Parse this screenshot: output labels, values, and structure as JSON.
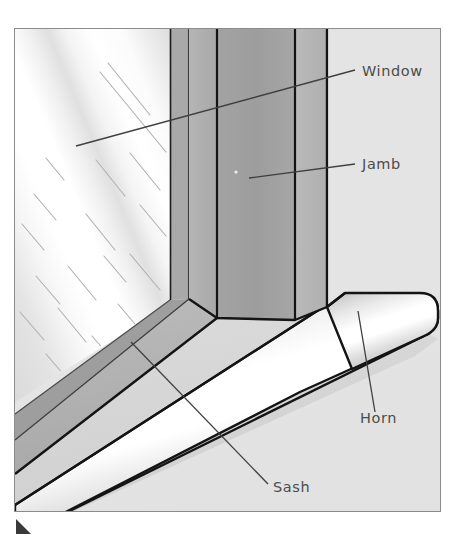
{
  "figure": {
    "bounds": {
      "x": 14,
      "y": 28,
      "width": 427,
      "height": 484
    },
    "background_color": "#ffffff",
    "panel_color": "#e6e6e6",
    "border_color": "#8c8c8c"
  },
  "labels": [
    {
      "id": "window",
      "text": "Window",
      "text_x": 362,
      "text_y": 76,
      "leader": {
        "x1": 355,
        "y1": 70,
        "x2": 76,
        "y2": 146
      },
      "color": "#4c4c4c"
    },
    {
      "id": "jamb",
      "text": "Jamb",
      "text_x": 362,
      "text_y": 169,
      "leader": {
        "x1": 355,
        "y1": 164,
        "x2": 249,
        "y2": 178
      },
      "color": "#4c4c4c"
    },
    {
      "id": "horn",
      "text": "Horn",
      "text_x": 360,
      "text_y": 423,
      "leader": {
        "x1": 375,
        "y1": 412,
        "x2": 358,
        "y2": 311
      },
      "color": "#4c4c4c"
    },
    {
      "id": "sash",
      "text": "Sash",
      "text_x": 273,
      "text_y": 492,
      "leader": {
        "x1": 268,
        "y1": 484,
        "x2": 131,
        "y2": 342
      },
      "color": "#4c4c4c"
    }
  ],
  "parts": {
    "glass": {
      "name": "Glass pane",
      "fill": "#f2f2f2",
      "highlight": "#ffffff",
      "shade": "#dcdcdc",
      "streak_color": "#b4b4b4"
    },
    "frame": {
      "name": "Window frame",
      "fill": "#b8b8b8",
      "edge": "#2b2b2b"
    },
    "jamb": {
      "name": "Jamb",
      "front_fill": "#a6a6a6",
      "side_fill": "#bdbdbd",
      "inner_fill": "#9c9c9c",
      "edge": "#141414"
    },
    "sill": {
      "name": "Sill / Sash",
      "top_fill": "#d4d4d4",
      "nose_highlight": "#ffffff",
      "nose_shade": "#bcbcbc",
      "edge": "#141414"
    },
    "horn": {
      "name": "Horn",
      "fill": "#e8e8e8",
      "edge": "#141414"
    }
  },
  "corner_mark": {
    "name": "page corner mark",
    "x": 16,
    "y": 519,
    "color": "#3a3a3a"
  }
}
